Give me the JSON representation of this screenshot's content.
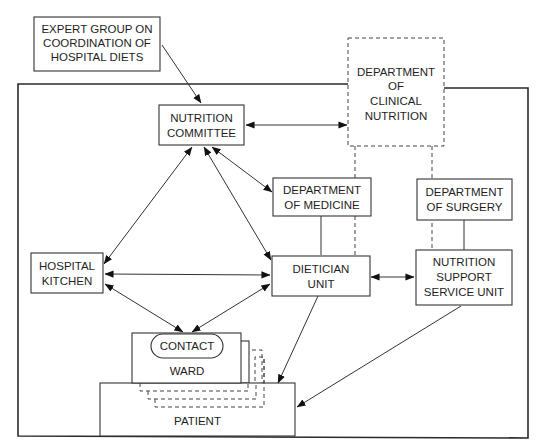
{
  "diagram": {
    "nodes": {
      "expert_group": {
        "lines": [
          "EXPERT GROUP ON",
          "COORDINATION OF",
          "HOSPITAL DIETS"
        ]
      },
      "nutrition_committee": {
        "lines": [
          "NUTRITION",
          "COMMITTEE"
        ]
      },
      "clinical_nutrition": {
        "lines": [
          "DEPARTMENT",
          "OF",
          "CLINICAL",
          "NUTRITION"
        ]
      },
      "dept_medicine": {
        "lines": [
          "DEPARTMENT",
          "OF MEDICINE"
        ]
      },
      "dept_surgery": {
        "lines": [
          "DEPARTMENT",
          "OF SURGERY"
        ]
      },
      "hospital_kitchen": {
        "lines": [
          "HOSPITAL",
          "KITCHEN"
        ]
      },
      "dietician_unit": {
        "lines": [
          "DIETICIAN",
          "UNIT"
        ]
      },
      "nssu": {
        "lines": [
          "NUTRITION",
          "SUPPORT",
          "SERVICE UNIT"
        ]
      },
      "contact": {
        "lines": [
          "CONTACT"
        ]
      },
      "ward": {
        "lines": [
          "WARD"
        ]
      },
      "patient": {
        "lines": [
          "PATIENT"
        ]
      }
    },
    "edges": [
      {
        "from": "expert_group",
        "to": "nutrition_committee",
        "type": "arrow"
      },
      {
        "from": "nutrition_committee",
        "to": "clinical_nutrition",
        "type": "bidirectional"
      },
      {
        "from": "nutrition_committee",
        "to": "dept_medicine",
        "type": "bidirectional"
      },
      {
        "from": "nutrition_committee",
        "to": "hospital_kitchen",
        "type": "bidirectional"
      },
      {
        "from": "nutrition_committee",
        "to": "dietician_unit",
        "type": "bidirectional"
      },
      {
        "from": "hospital_kitchen",
        "to": "dietician_unit",
        "type": "bidirectional"
      },
      {
        "from": "hospital_kitchen",
        "to": "contact",
        "type": "bidirectional"
      },
      {
        "from": "dietician_unit",
        "to": "contact",
        "type": "bidirectional"
      },
      {
        "from": "dietician_unit",
        "to": "nssu",
        "type": "bidirectional"
      },
      {
        "from": "dietician_unit",
        "to": "patient",
        "type": "arrow"
      },
      {
        "from": "nssu",
        "to": "patient",
        "type": "arrow"
      },
      {
        "from": "dept_medicine",
        "to": "dietician_unit",
        "type": "line"
      },
      {
        "from": "dept_surgery",
        "to": "nssu",
        "type": "line"
      },
      {
        "from": "clinical_nutrition",
        "to": "dietician_unit",
        "type": "dashed"
      },
      {
        "from": "clinical_nutrition",
        "to": "nssu",
        "type": "dashed"
      }
    ]
  }
}
